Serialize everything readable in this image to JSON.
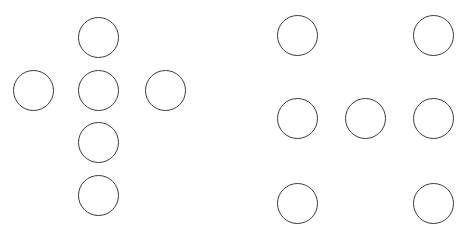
{
  "figure": {
    "width": 461,
    "height": 239,
    "background_color": "#ffffff",
    "circle": {
      "diameter": 41,
      "stroke_color": "#3a3a3c",
      "stroke_width": 1.5,
      "fill_color": "transparent"
    }
  },
  "groups": [
    {
      "id": "left-group",
      "name": "cross-pattern",
      "circle_count": 6,
      "circles": [
        {
          "id": "L1",
          "name": "top-circle",
          "x": 78,
          "y": 17,
          "d": 41
        },
        {
          "id": "L2",
          "name": "left-arm-circle",
          "x": 13,
          "y": 70,
          "d": 41
        },
        {
          "id": "L3",
          "name": "center-circle",
          "x": 78,
          "y": 70,
          "d": 41
        },
        {
          "id": "L4",
          "name": "right-arm-circle",
          "x": 145,
          "y": 70,
          "d": 41
        },
        {
          "id": "L5",
          "name": "lower-middle-circle",
          "x": 78,
          "y": 122,
          "d": 41
        },
        {
          "id": "L6",
          "name": "bottom-circle",
          "x": 78,
          "y": 175,
          "d": 41
        }
      ]
    },
    {
      "id": "right-group",
      "name": "grid-pattern",
      "circle_count": 7,
      "circles": [
        {
          "id": "R1",
          "name": "top-left-circle",
          "x": 277,
          "y": 15,
          "d": 41
        },
        {
          "id": "R2",
          "name": "top-right-circle",
          "x": 413,
          "y": 15,
          "d": 41
        },
        {
          "id": "R3",
          "name": "middle-left-circle",
          "x": 277,
          "y": 98,
          "d": 41
        },
        {
          "id": "R4",
          "name": "middle-center-circle",
          "x": 345,
          "y": 98,
          "d": 41
        },
        {
          "id": "R5",
          "name": "middle-right-circle",
          "x": 413,
          "y": 98,
          "d": 41
        },
        {
          "id": "R6",
          "name": "bottom-left-circle",
          "x": 277,
          "y": 183,
          "d": 41
        },
        {
          "id": "R7",
          "name": "bottom-right-circle",
          "x": 413,
          "y": 183,
          "d": 41
        }
      ]
    }
  ]
}
